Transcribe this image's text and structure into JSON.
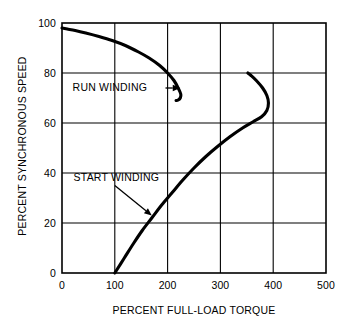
{
  "chart_data": {
    "type": "line",
    "title": "",
    "xlabel": "PERCENT FULL-LOAD TORQUE",
    "ylabel": "PERCENT SYNCHRONOUS SPEED",
    "xlim": [
      0,
      500
    ],
    "ylim": [
      0,
      100
    ],
    "xticks": [
      0,
      100,
      200,
      300,
      400,
      500
    ],
    "yticks": [
      0,
      20,
      40,
      60,
      80,
      100
    ],
    "xtick_labels": [
      "0",
      "100",
      "200",
      "300",
      "400",
      "500"
    ],
    "ytick_labels": [
      "0",
      "20",
      "40",
      "60",
      "80",
      "100"
    ],
    "grid": true,
    "legend": "none",
    "line_color": "#000000",
    "grid_color": "#000000",
    "background": "#ffffff",
    "series": [
      {
        "name": "RUN WINDING",
        "points": [
          [
            0,
            98
          ],
          [
            10,
            97.6
          ],
          [
            25,
            97.0
          ],
          [
            45,
            96.0
          ],
          [
            70,
            94.6
          ],
          [
            95,
            93.0
          ],
          [
            120,
            91.0
          ],
          [
            145,
            88.4
          ],
          [
            165,
            86.0
          ],
          [
            185,
            83.0
          ],
          [
            200,
            80.0
          ],
          [
            212,
            77.0
          ],
          [
            220,
            74.0
          ],
          [
            225,
            71.5
          ],
          [
            224,
            70.0
          ],
          [
            220,
            69.2
          ],
          [
            216,
            69.0
          ]
        ]
      },
      {
        "name": "START WINDING",
        "points": [
          [
            100,
            0
          ],
          [
            118,
            6
          ],
          [
            136,
            12
          ],
          [
            152,
            17
          ],
          [
            170,
            22
          ],
          [
            188,
            27
          ],
          [
            208,
            32
          ],
          [
            228,
            37
          ],
          [
            250,
            42
          ],
          [
            272,
            46.5
          ],
          [
            294,
            50.5
          ],
          [
            318,
            54.5
          ],
          [
            342,
            58
          ],
          [
            362,
            60.5
          ],
          [
            378,
            62.5
          ],
          [
            388,
            65
          ],
          [
            391,
            68
          ],
          [
            388,
            71
          ],
          [
            380,
            74
          ],
          [
            368,
            77
          ],
          [
            358,
            79
          ],
          [
            352,
            80
          ]
        ]
      }
    ],
    "annotations": [
      {
        "name": "RUN WINDING",
        "label": "RUN WINDING",
        "text_x": 20,
        "text_y": 74,
        "arrow_from": [
          196,
          74
        ],
        "arrow_to": [
          224,
          74
        ]
      },
      {
        "name": "START WINDING",
        "label": "START WINDING",
        "text_x": 22,
        "text_y": 38,
        "arrow_from": [
          100,
          35
        ],
        "arrow_to": [
          170,
          23
        ]
      }
    ]
  }
}
